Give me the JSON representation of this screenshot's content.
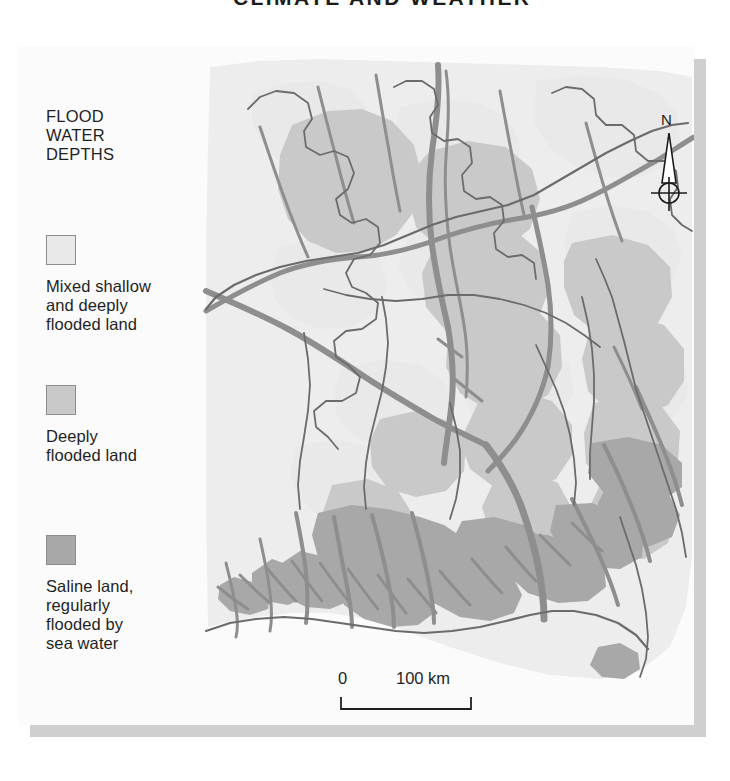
{
  "page": {
    "header_title": "CLIMATE AND WEATHER",
    "background_color": "#ffffff",
    "plate_color": "#fbfbfb",
    "shadow_color": "#cfcfcf",
    "header_rule_color": "#262626"
  },
  "legend": {
    "title": "FLOOD\nWATER\nDEPTHS",
    "entries": [
      {
        "swatch_color": "#e9e9e9",
        "border_color": "#8d8d8d",
        "label": "Mixed shallow\nand deeply\nflooded land"
      },
      {
        "swatch_color": "#c9c9c9",
        "border_color": "#8d8d8d",
        "label": "Deeply\nflooded land"
      },
      {
        "swatch_color": "#a8a8a8",
        "border_color": "#8d8d8d",
        "label": "Saline land,\nregularly\nflooded by\nsea water"
      }
    ]
  },
  "map": {
    "title": "Flood water depths map of Bangladesh",
    "land_base_color": "#ededed",
    "sea_color": "#fbfbfb",
    "river_color": "#8e8e8e",
    "boundary_color": "#6b6b6b",
    "class_colors": {
      "mixed_shallow_and_deeply_flooded": "#e9e9e9",
      "deeply_flooded": "#c9c9c9",
      "saline_regularly_flooded": "#a8a8a8"
    }
  },
  "north_arrow": {
    "label": "N",
    "stroke_color": "#1a1a1a"
  },
  "scalebar": {
    "start_label": "0",
    "end_label": "100 km",
    "unit": "km",
    "span_value": 100,
    "span_pixels": 130,
    "stroke_color": "#1f1f1f"
  }
}
